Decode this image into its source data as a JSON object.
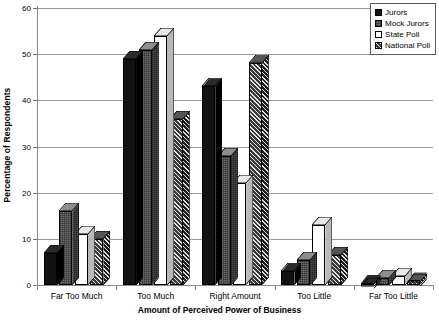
{
  "chart_data": {
    "type": "bar",
    "title": "",
    "xlabel": "Amount of Perceived Power of Business",
    "ylabel": "Percentage of Respondents",
    "ylim": [
      0,
      60
    ],
    "ytick_step": 10,
    "yticks": [
      "0",
      "10",
      "20",
      "30",
      "40",
      "50",
      "60"
    ],
    "grid": true,
    "legend_position": "top-right",
    "style": "3d-clustered-column",
    "categories": [
      "Far Too Much",
      "Too Much",
      "Right Amount",
      "Too Little",
      "Far Too Little"
    ],
    "series": [
      {
        "name": "Jurors",
        "color": "#121212",
        "pattern": "solid",
        "values": [
          7,
          49,
          43,
          3,
          0.5
        ]
      },
      {
        "name": "Mock Jurors",
        "color": "#6f6f6f",
        "pattern": "dotted",
        "values": [
          16,
          51,
          28,
          5.5,
          1.5
        ]
      },
      {
        "name": "State Poll",
        "color": "#ffffff",
        "pattern": "empty",
        "values": [
          11,
          54,
          22,
          13,
          2
        ]
      },
      {
        "name": "National Poll",
        "color": "#3a3a3a",
        "pattern": "hatch",
        "values": [
          10,
          36,
          48,
          6.5,
          1
        ]
      }
    ]
  },
  "legend": {
    "items": [
      {
        "label": "Jurors"
      },
      {
        "label": "Mock Jurors"
      },
      {
        "label": "State Poll"
      },
      {
        "label": "National Poll"
      }
    ]
  }
}
